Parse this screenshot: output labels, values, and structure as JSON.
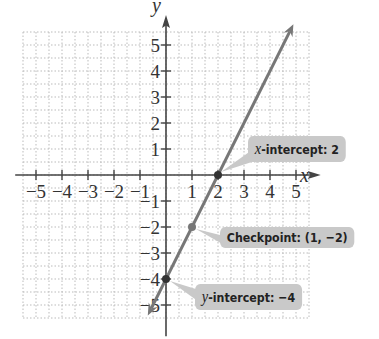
{
  "chart_data": {
    "type": "line",
    "title": "",
    "xlabel": "x",
    "ylabel": "y",
    "xlim": [
      -5.5,
      5.5
    ],
    "ylim": [
      -5.5,
      5.5
    ],
    "grid": true,
    "x_ticks": [
      -5,
      -4,
      -3,
      -2,
      -1,
      1,
      2,
      3,
      4,
      5
    ],
    "y_ticks": [
      -5,
      -4,
      -3,
      -2,
      -1,
      1,
      2,
      3,
      4,
      5
    ],
    "series": [
      {
        "name": "y = 2x - 4",
        "x": [
          -0.7,
          4.9
        ],
        "y": [
          -5.4,
          5.8
        ],
        "color": "#777777"
      }
    ],
    "points": [
      {
        "x": 2,
        "y": 0,
        "label": "x-intercept: 2"
      },
      {
        "x": 1,
        "y": -2,
        "label": "Checkpoint: (1, -2)"
      },
      {
        "x": 0,
        "y": -4,
        "label": "y-intercept: -4"
      }
    ]
  },
  "axes": {
    "x_label": "x",
    "y_label": "y"
  },
  "callouts": {
    "x_intercept": {
      "var": "x",
      "text": "-intercept: 2"
    },
    "checkpoint": {
      "text": "Checkpoint: (1, −2)"
    },
    "y_intercept": {
      "var": "y",
      "text": "-intercept: −4"
    }
  }
}
